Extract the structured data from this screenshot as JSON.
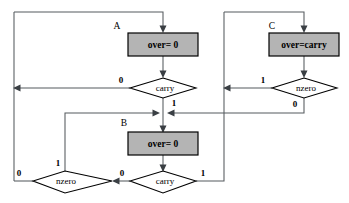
{
  "diagram": {
    "type": "state-transition-flowchart",
    "background_color": "#ffffff",
    "box_fill_color": "#b4b4b4",
    "line_color": "#555a5e",
    "states": [
      {
        "id": "A",
        "state_label": "A",
        "action_text": "over= 0",
        "decision_text": "carry",
        "branches": [
          {
            "value": "0",
            "direction": "left"
          },
          {
            "value": "1",
            "direction": "down"
          }
        ]
      },
      {
        "id": "C",
        "state_label": "C",
        "action_text": "over=carry",
        "decision_text": "nzero",
        "branches": [
          {
            "value": "1",
            "direction": "left"
          },
          {
            "value": "0",
            "direction": "down"
          }
        ]
      },
      {
        "id": "B",
        "state_label": "B",
        "action_text": "over= 0",
        "decision_text": "carry",
        "branches": [
          {
            "value": "0",
            "direction": "left"
          },
          {
            "value": "1",
            "direction": "right"
          }
        ]
      }
    ],
    "extra_decisions": [
      {
        "id": "B-nzero",
        "decision_text": "nzero",
        "branches": [
          {
            "value": "0",
            "direction": "left"
          },
          {
            "value": "1",
            "direction": "up"
          }
        ]
      }
    ],
    "edge_labels": {
      "a_carry_zero": "0",
      "a_carry_one": "1",
      "c_nzero_one": "1",
      "c_nzero_zero": "0",
      "b_carry_zero": "0",
      "b_carry_one": "1",
      "b_nzero_zero": "0",
      "b_nzero_one": "1"
    },
    "node_texts": {
      "label_a": "A",
      "label_b": "B",
      "label_c": "C",
      "box_a": "over= 0",
      "box_b": "over= 0",
      "box_c": "over=carry",
      "diamond_a": "carry",
      "diamond_b": "carry",
      "diamond_c": "nzero",
      "diamond_b_nzero": "nzero"
    }
  }
}
